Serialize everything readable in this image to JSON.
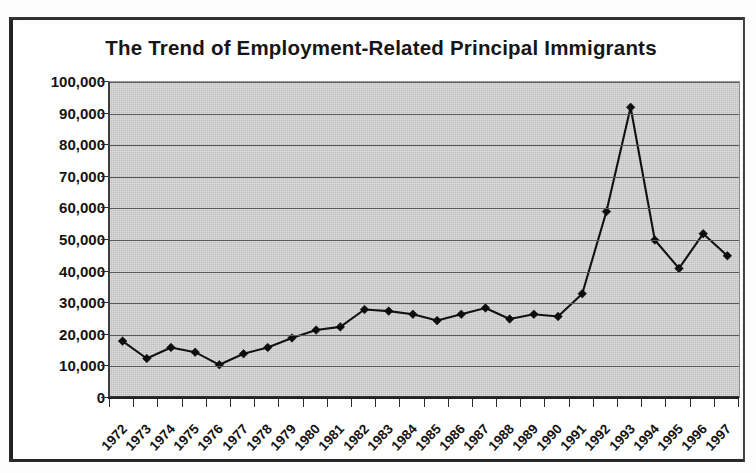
{
  "chart_data": {
    "type": "line",
    "title": "The Trend of Employment-Related Principal Immigrants",
    "xlabel": "",
    "ylabel": "",
    "ylim": [
      0,
      100000
    ],
    "ytick_step": 10000,
    "grid": true,
    "legend": "none",
    "categories": [
      "1972",
      "1973",
      "1974",
      "1975",
      "1976",
      "1977",
      "1978",
      "1979",
      "1980",
      "1981",
      "1982",
      "1983",
      "1984",
      "1985",
      "1986",
      "1987",
      "1988",
      "1989",
      "1990",
      "1991",
      "1992",
      "1993",
      "1994",
      "1995",
      "1996",
      "1997"
    ],
    "values": [
      18000,
      12500,
      16000,
      14500,
      10500,
      14000,
      16000,
      19000,
      21500,
      22500,
      28000,
      27500,
      26500,
      24500,
      26500,
      28500,
      25000,
      26500,
      25800,
      33000,
      59000,
      92000,
      50000,
      41000,
      52000,
      45000
    ],
    "ytick_labels": [
      "100,000",
      "90,000",
      "80,000",
      "70,000",
      "60,000",
      "50,000",
      "40,000",
      "30,000",
      "20,000",
      "10,000",
      "0"
    ],
    "ytick_values": [
      100000,
      90000,
      80000,
      70000,
      60000,
      50000,
      40000,
      30000,
      20000,
      10000,
      0
    ],
    "series": [
      {
        "name": "Employment-Related Principal Immigrants",
        "values": [
          18000,
          12500,
          16000,
          14500,
          10500,
          14000,
          16000,
          19000,
          21500,
          22500,
          28000,
          27500,
          26500,
          24500,
          26500,
          28500,
          25000,
          26500,
          25800,
          33000,
          59000,
          92000,
          50000,
          41000,
          52000,
          45000
        ],
        "marker": "diamond",
        "color": "#0d0d0d"
      }
    ]
  },
  "colors": {
    "plot_background": "#c9c9c9",
    "gridline": "#5a5a5a",
    "line": "#121212",
    "text": "#141414",
    "page_background": "#ffffff",
    "frame": "#1c1c1c"
  }
}
